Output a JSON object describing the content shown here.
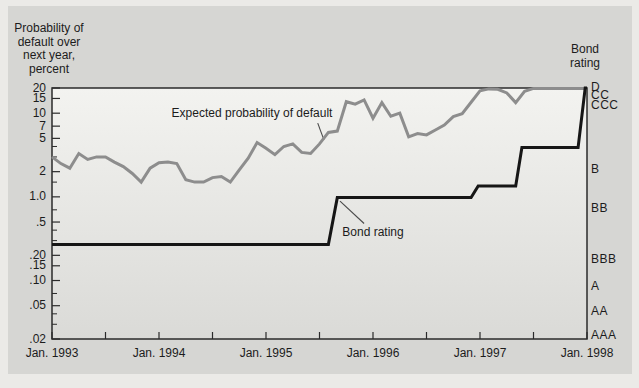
{
  "colors": {
    "page_bg": "#ebeae7",
    "panel_bg": "#d6d6d3",
    "plot_gradient_top": "#f3f3f0",
    "plot_gradient_bottom": "#dadad7",
    "frame": "#2b2b2b",
    "probability_line": "#8d8d8d",
    "bond_rating_line": "#161616",
    "text": "#1c1c1c"
  },
  "chart_data": {
    "type": "line",
    "y_axis": {
      "title_lines": [
        "Probability of",
        "default over",
        "next year,",
        "percent"
      ],
      "scale": "log",
      "range": [
        0.02,
        20
      ],
      "labeled_ticks": [
        {
          "label": "20",
          "value": 20
        },
        {
          "label": "15",
          "value": 15
        },
        {
          "label": "10",
          "value": 10
        },
        {
          "label": "7",
          "value": 7
        },
        {
          "label": "5",
          "value": 5
        },
        {
          "label": "2",
          "value": 2
        },
        {
          "label": "1.0",
          "value": 1.0
        },
        {
          "label": ".5",
          "value": 0.5
        },
        {
          "label": ".20",
          "value": 0.2
        },
        {
          "label": ".15",
          "value": 0.15
        },
        {
          "label": ".10",
          "value": 0.1
        },
        {
          "label": ".05",
          "value": 0.05
        },
        {
          "label": ".02",
          "value": 0.02
        }
      ],
      "minor_ticks": [
        4,
        3,
        1.5,
        0.7,
        0.4,
        0.3,
        0.07,
        0.04,
        0.03
      ]
    },
    "x_axis": {
      "unit": "month",
      "start": "Jan. 1993",
      "end": "Jan. 1998",
      "labels": [
        {
          "label": "Jan. 1993",
          "month": 0
        },
        {
          "label": "Jan. 1994",
          "month": 12
        },
        {
          "label": "Jan. 1995",
          "month": 24
        },
        {
          "label": "Jan. 1996",
          "month": 36
        },
        {
          "label": "Jan. 1997",
          "month": 48
        },
        {
          "label": "Jan. 1998",
          "month": 60
        }
      ],
      "tick_months": [
        0,
        6,
        12,
        18,
        24,
        30,
        36,
        42,
        48,
        54,
        60
      ]
    },
    "right_axis": {
      "title_lines": [
        "Bond",
        "rating"
      ],
      "ratings": [
        {
          "label": "D",
          "value": 20.3
        },
        {
          "label": "CC",
          "value": 16.4
        },
        {
          "label": "CCC",
          "value": 12.5
        },
        {
          "label": "B",
          "value": 2.1
        },
        {
          "label": "BB",
          "value": 0.72
        },
        {
          "label": "BBB",
          "value": 0.18
        },
        {
          "label": "A",
          "value": 0.084
        },
        {
          "label": "AA",
          "value": 0.043
        },
        {
          "label": "AAA",
          "value": 0.022
        }
      ]
    },
    "series": [
      {
        "name": "Expected probability of default",
        "style": "jagged-monthly",
        "color": "#8d8d8d",
        "stroke_width": 3,
        "start_month": 0,
        "monthly_values": [
          3.0,
          2.5,
          2.2,
          3.3,
          2.8,
          3.0,
          3.0,
          2.6,
          2.3,
          1.9,
          1.5,
          2.2,
          2.55,
          2.6,
          2.5,
          1.6,
          1.5,
          1.5,
          1.7,
          1.75,
          1.5,
          2.1,
          2.9,
          4.45,
          3.8,
          3.2,
          4.0,
          4.3,
          3.4,
          3.3,
          4.3,
          5.9,
          6.1,
          13.7,
          12.8,
          14.4,
          8.7,
          13.4,
          9.2,
          10.0,
          5.2,
          5.7,
          5.5,
          6.3,
          7.2,
          9.1,
          9.9,
          13.5,
          18.5,
          19.5,
          19.3,
          17.5,
          13.4,
          18.2,
          19.8,
          19.8,
          19.8,
          19.8,
          19.8,
          19.8,
          19.8
        ]
      },
      {
        "name": "Bond rating",
        "style": "step",
        "color": "#161616",
        "stroke_width": 3,
        "breakpoints": [
          [
            0,
            0.27
          ],
          [
            31,
            0.27
          ],
          [
            32,
            0.98
          ],
          [
            47,
            0.98
          ],
          [
            47.8,
            1.35
          ],
          [
            52,
            1.35
          ],
          [
            52.7,
            3.9
          ],
          [
            59,
            3.9
          ],
          [
            59.8,
            20
          ],
          [
            60,
            20
          ]
        ]
      }
    ],
    "annotations": [
      {
        "text": "Expected probability of default",
        "center": {
          "month": 22.4,
          "value": 10.0
        },
        "pointer": [
          [
            29.8,
            7.6
          ],
          [
            30.5,
            4.8
          ]
        ]
      },
      {
        "text": "Bond rating",
        "center": {
          "month": 36.0,
          "value": 0.38
        },
        "pointer": [
          [
            32.3,
            0.89
          ],
          [
            35.0,
            0.48
          ]
        ]
      }
    ]
  }
}
